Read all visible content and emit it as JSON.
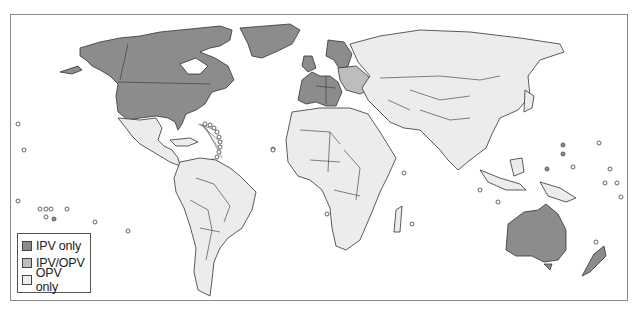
{
  "map": {
    "title": "",
    "categories": [
      {
        "key": "ipv",
        "label": "IPV only",
        "color": "#8c8c8c"
      },
      {
        "key": "mix",
        "label": "IPV/OPV",
        "color": "#bdbdbd"
      },
      {
        "key": "opv",
        "label": "OPV only",
        "color": "#ececec"
      }
    ],
    "regions": {
      "ipv_only": [
        "Canada",
        "United States",
        "Greenland",
        "Western Europe",
        "Nordic countries",
        "Australia",
        "New Zealand"
      ],
      "ipv_opv": [
        "Central/Eastern Europe (partial)",
        "Baltic states"
      ],
      "opv_only": [
        "Latin America",
        "Africa",
        "Russia",
        "Asia",
        "Middle East",
        "Southeast Asia",
        "Papua New Guinea"
      ]
    }
  },
  "legend": {
    "items": [
      {
        "label": "IPV only",
        "color": "#8c8c8c"
      },
      {
        "label": "IPV/OPV",
        "color": "#bdbdbd"
      },
      {
        "label": "OPV only",
        "color": "#ececec"
      }
    ]
  }
}
